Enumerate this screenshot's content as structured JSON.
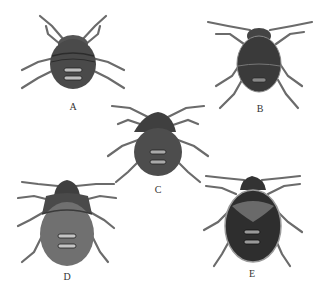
{
  "figure": {
    "background": "#ffffff",
    "specimens": [
      {
        "label": "A",
        "cx": 73,
        "cy": 58,
        "w": 46,
        "h": 52,
        "shade": "#4a4a4a",
        "style": "rounded"
      },
      {
        "label": "B",
        "cx": 259,
        "cy": 62,
        "w": 44,
        "h": 56,
        "shade": "#3a3a3a",
        "style": "oval"
      },
      {
        "label": "C",
        "cx": 158,
        "cy": 150,
        "w": 48,
        "h": 56,
        "shade": "#474747",
        "style": "pear"
      },
      {
        "label": "D",
        "cx": 67,
        "cy": 228,
        "w": 56,
        "h": 66,
        "shade": "#6a6a6a",
        "style": "broad"
      },
      {
        "label": "E",
        "cx": 252,
        "cy": 228,
        "w": 56,
        "h": 66,
        "shade": "#2e2e2e",
        "style": "patterned"
      }
    ],
    "label_positions": [
      {
        "label": "A",
        "x": 73,
        "y": 101
      },
      {
        "label": "B",
        "x": 260,
        "y": 103
      },
      {
        "label": "C",
        "x": 158,
        "y": 184
      },
      {
        "label": "D",
        "x": 67,
        "y": 271
      },
      {
        "label": "E",
        "x": 252,
        "y": 268
      }
    ]
  }
}
